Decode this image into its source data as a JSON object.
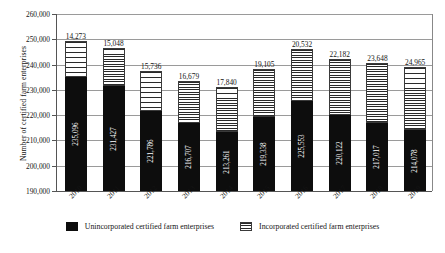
{
  "chart_data": {
    "type": "bar",
    "subtype": "stacked-vertical",
    "title": "",
    "xlabel": "",
    "ylabel": "Number of certified farm enterprises",
    "ylim": [
      190000,
      260000
    ],
    "ytick_step": 10000,
    "ytick_labels": [
      "260,000",
      "250,000",
      "240,000",
      "230,000",
      "220,000",
      "210,000",
      "200,000",
      "190,000"
    ],
    "ytick_values": [
      260000,
      250000,
      240000,
      230000,
      220000,
      210000,
      200000,
      190000
    ],
    "grid": true,
    "legend_position": "bottom-center",
    "categories": [
      "2010",
      "2011",
      "2012",
      "2013",
      "2014",
      "2015",
      "2016",
      "2017",
      "2018",
      "2019"
    ],
    "series": [
      {
        "name": "Unincorporated certified farm enterprises",
        "color": "#0d0d0d",
        "pattern": "solid",
        "values": [
          235096,
          231427,
          221786,
          216707,
          213261,
          219338,
          225553,
          220122,
          217017,
          214078
        ],
        "labels": [
          "235,096",
          "231,427",
          "221,786",
          "216,707",
          "213,261",
          "219,338",
          "225,553",
          "220,122",
          "217,017",
          "214,078"
        ]
      },
      {
        "name": "Incorporated certified farm enterprises",
        "color": "#ffffff",
        "pattern": "horizontal-stripes",
        "values": [
          14273,
          15048,
          15736,
          16679,
          17840,
          19105,
          20532,
          22182,
          23648,
          24965
        ],
        "labels": [
          "14,273",
          "15,048",
          "15,736",
          "16,679",
          "17,840",
          "19,105",
          "20,532",
          "22,182",
          "23,648",
          "24,965"
        ]
      }
    ],
    "totals": [
      249369,
      246475,
      237522,
      233386,
      231101,
      238443,
      246085,
      242304,
      240665,
      239043
    ]
  },
  "legend": {
    "items": [
      {
        "label": "Unincorporated certified farm enterprises",
        "swatch": "black-square-icon"
      },
      {
        "label": "Incorporated certified farm enterprises",
        "swatch": "hatched-square-icon"
      }
    ]
  }
}
